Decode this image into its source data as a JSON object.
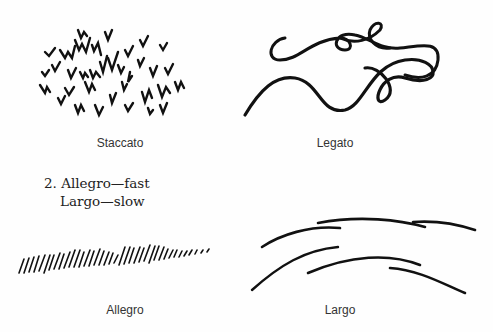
{
  "figures": {
    "staccato": {
      "caption": "Staccato",
      "icon": "staccato-marks"
    },
    "legato": {
      "caption": "Legato",
      "icon": "legato-ribbon"
    },
    "allegro": {
      "caption": "Allegro",
      "icon": "allegro-strokes"
    },
    "largo": {
      "caption": "Largo",
      "icon": "largo-arcs"
    }
  },
  "heading": {
    "line1": "2. Allegro—fast",
    "line2": "Largo—slow"
  },
  "colors": {
    "ink": "#111111",
    "text": "#333333",
    "paper": "#fefefe"
  }
}
